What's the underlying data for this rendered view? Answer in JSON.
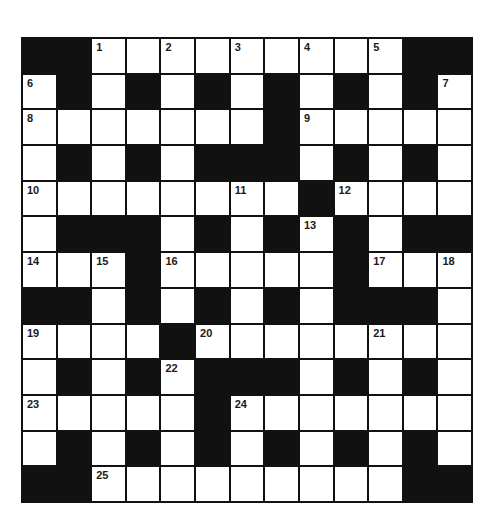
{
  "crossword": {
    "rows": 13,
    "cols": 13,
    "colors": {
      "block": "#111111",
      "cell": "#ffffff",
      "number": "#1a1a1a"
    },
    "grid": [
      [
        "#",
        "#",
        "1",
        "",
        "2",
        "",
        "3",
        "",
        "4",
        "",
        "5",
        "#",
        "#"
      ],
      [
        "6",
        "#",
        "",
        "#",
        "",
        "#",
        "",
        "#",
        "",
        "#",
        "",
        "#",
        "7"
      ],
      [
        "8",
        "",
        "",
        "",
        "",
        "",
        "",
        "#",
        "9",
        "",
        "",
        "",
        ""
      ],
      [
        "",
        "#",
        "",
        "#",
        "",
        "#",
        "#",
        "#",
        "",
        "#",
        "",
        "#",
        ""
      ],
      [
        "10",
        "",
        "",
        "",
        "",
        "",
        "11",
        "",
        "#",
        "12",
        "",
        "",
        ""
      ],
      [
        "",
        "#",
        "#",
        "#",
        "",
        "#",
        "",
        "#",
        "13",
        "#",
        "",
        "#",
        "#"
      ],
      [
        "14",
        "",
        "15",
        "#",
        "16",
        "",
        "",
        "",
        "",
        "#",
        "17",
        "",
        "18"
      ],
      [
        "#",
        "#",
        "",
        "#",
        "",
        "#",
        "",
        "#",
        "",
        "#",
        "#",
        "#",
        ""
      ],
      [
        "19",
        "",
        "",
        "",
        "#",
        "20",
        "",
        "",
        "",
        "",
        "21",
        "",
        ""
      ],
      [
        "",
        "#",
        "",
        "#",
        "22",
        "#",
        "#",
        "#",
        "",
        "#",
        "",
        "#",
        ""
      ],
      [
        "23",
        "",
        "",
        "",
        "",
        "#",
        "24",
        "",
        "",
        "",
        "",
        "",
        ""
      ],
      [
        "",
        "#",
        "",
        "#",
        "",
        "#",
        "",
        "#",
        "",
        "#",
        "",
        "#",
        ""
      ],
      [
        "#",
        "#",
        "25",
        "",
        "",
        "",
        "",
        "",
        "",
        "",
        "",
        "#",
        "#"
      ]
    ]
  }
}
